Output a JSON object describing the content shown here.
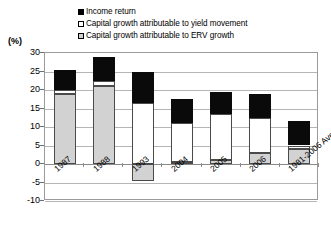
{
  "axis": {
    "unit_label": "(%)",
    "y_ticks": [
      "30",
      "25",
      "20",
      "15",
      "10",
      "5",
      "0",
      "-5",
      "-10"
    ],
    "y_min": -10,
    "y_max": 30
  },
  "legend": {
    "items": [
      {
        "label": "Income return",
        "swatch": "black-square-icon",
        "color": "#000000"
      },
      {
        "label": "Capital growth attributable to yield movement",
        "swatch": "white-square-icon",
        "color": "#ffffff"
      },
      {
        "label": "Capital growth attributable to ERV growth",
        "swatch": "grey-square-icon",
        "color": "#cfcfcf"
      }
    ]
  },
  "chart_data": {
    "type": "bar",
    "title": "",
    "subtitle": "",
    "xlabel": "",
    "ylabel": "(%)",
    "ylim": [
      -10,
      30
    ],
    "grid": true,
    "stacked": true,
    "legend_position": "top",
    "categories": [
      "1987",
      "1988",
      "1993",
      "2004",
      "2005",
      "2006",
      "1981-2006 Ave"
    ],
    "series": [
      {
        "name": "Capital growth attributable to ERV growth",
        "color": "#d2d2d2",
        "values": [
          19.0,
          21.0,
          -4.5,
          0.5,
          1.0,
          3.0,
          4.0
        ]
      },
      {
        "name": "Capital growth attributable to yield movement",
        "color": "#ffffff",
        "values": [
          1.0,
          1.5,
          16.5,
          10.5,
          12.5,
          9.5,
          1.0
        ]
      },
      {
        "name": "Income return",
        "color": "#000000",
        "values": [
          5.5,
          6.5,
          8.5,
          6.5,
          6.0,
          6.5,
          6.5
        ]
      }
    ],
    "totals_above_zero": [
      25.5,
      29.0,
      25.0,
      17.5,
      19.5,
      19.0,
      11.5
    ]
  }
}
